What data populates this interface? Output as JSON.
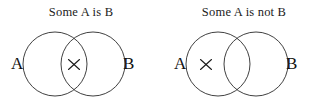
{
  "figure": {
    "title": "",
    "background_color": "#ffffff",
    "stroke_color": "#2a2a2a",
    "text_color": "#1a1a1a"
  },
  "diagrams": [
    {
      "id": "some-a-is-b",
      "caption": "Some A is B",
      "left_set_label": "A",
      "right_set_label": "B",
      "marker": {
        "glyph": "×",
        "name": "x-marker",
        "region": "overlap",
        "meaning": "at least one thing that is both A and B"
      }
    },
    {
      "id": "some-a-is-not-b",
      "caption": "Some A is not B",
      "left_set_label": "A",
      "right_set_label": "B",
      "marker": {
        "glyph": "×",
        "name": "x-marker",
        "region": "a-only",
        "meaning": "at least one thing that is A but not B"
      }
    }
  ]
}
